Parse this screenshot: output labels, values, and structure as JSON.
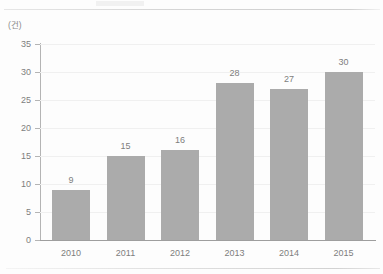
{
  "chart_data": {
    "type": "bar",
    "title": "",
    "xlabel": "",
    "ylabel": "",
    "unit_label": "(건)",
    "categories": [
      "2010",
      "2011",
      "2012",
      "2013",
      "2014",
      "2015"
    ],
    "values": [
      9,
      15,
      16,
      28,
      27,
      30
    ],
    "value_labels": [
      "9",
      "15",
      "16",
      "28",
      "27",
      "30"
    ],
    "ylim": [
      0,
      35
    ],
    "ytick_labels": [
      "0",
      "5",
      "10",
      "15",
      "20",
      "25",
      "30",
      "35"
    ],
    "ytick_values": [
      0,
      5,
      10,
      15,
      20,
      25,
      30,
      35
    ],
    "grid": true,
    "legend": null,
    "bar_color": "#ababab",
    "axis_color": "#9e9e9e",
    "grid_color": "#f0f0f0",
    "text_color": "#7d7d7d",
    "background": "#fdfdfd"
  }
}
